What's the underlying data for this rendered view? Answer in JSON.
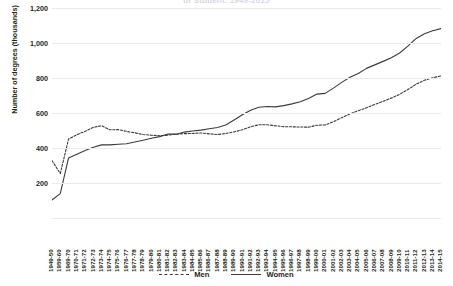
{
  "chart_data": {
    "type": "line",
    "title": "of Student, 1949-2015",
    "xlabel": "",
    "ylabel": "Number of degrees (thousands)",
    "ylim": [
      0,
      1200
    ],
    "yticks": [
      0,
      200,
      400,
      600,
      800,
      1000,
      1200
    ],
    "ytick_labels": [
      "",
      "200",
      "400",
      "600",
      "800",
      "1,000",
      "1,200"
    ],
    "grid": true,
    "legend_position": "bottom",
    "categories": [
      "1949-50",
      "1959-60",
      "1969-70",
      "1970-71",
      "1971-72",
      "1972-73",
      "1973-74",
      "1974-75",
      "1975-76",
      "1976-77",
      "1977-78",
      "1978-79",
      "1979-80",
      "1980-81",
      "1981-82",
      "1982-83",
      "1983-84",
      "1984-85",
      "1985-86",
      "1986-87",
      "1987-88",
      "1988-89",
      "1989-90",
      "1990-91",
      "1991-92",
      "1992-93",
      "1993-94",
      "1994-95",
      "1995-96",
      "1996-97",
      "1997-98",
      "1998-99",
      "1999-00",
      "2000-01",
      "2001-02",
      "2002-03",
      "2003-04",
      "2004-05",
      "2005-06",
      "2006-07",
      "2007-08",
      "2008-09",
      "2009-10",
      "2010-11",
      "2011-12",
      "2012-13",
      "2013-14",
      "2014-15"
    ],
    "series": [
      {
        "name": "Men",
        "style": "dashed",
        "color": "#3b3b3b",
        "values": [
          328,
          254,
          451,
          476,
          495,
          518,
          527,
          504,
          505,
          495,
          487,
          477,
          473,
          470,
          473,
          479,
          482,
          483,
          486,
          481,
          477,
          483,
          492,
          504,
          521,
          533,
          533,
          527,
          522,
          521,
          520,
          519,
          530,
          532,
          550,
          573,
          595,
          613,
          630,
          649,
          667,
          685,
          707,
          734,
          765,
          787,
          801,
          812
        ]
      },
      {
        "name": "Women",
        "style": "solid",
        "color": "#3b3b3b",
        "values": [
          103,
          139,
          343,
          364,
          386,
          404,
          418,
          418,
          421,
          424,
          434,
          444,
          456,
          465,
          480,
          479,
          491,
          497,
          502,
          510,
          517,
          531,
          560,
          590,
          616,
          633,
          637,
          635,
          642,
          652,
          664,
          683,
          708,
          712,
          742,
          775,
          804,
          826,
          855,
          875,
          895,
          916,
          943,
          982,
          1026,
          1053,
          1070,
          1082
        ]
      }
    ]
  }
}
